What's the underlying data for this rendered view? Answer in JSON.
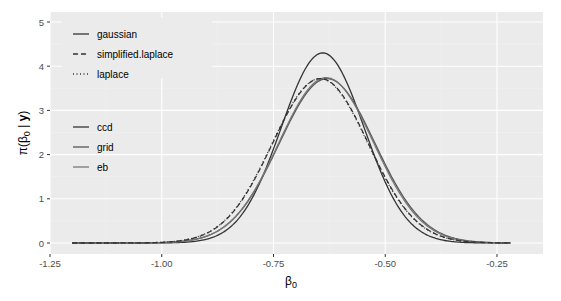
{
  "chart_data": {
    "type": "line",
    "title": "",
    "xlabel": "β0",
    "ylabel": "π(β0 | y)",
    "xlim": [
      -1.25,
      -0.18
    ],
    "ylim": [
      -0.2,
      5.2
    ],
    "x_ticks": [
      -1.25,
      -1.0,
      -0.75,
      -0.5,
      -0.25
    ],
    "x_tick_labels": [
      "-1.25",
      "-1.00",
      "-0.75",
      "-0.50",
      "-0.25"
    ],
    "y_ticks": [
      0,
      1,
      2,
      3,
      4,
      5
    ],
    "y_tick_labels": [
      "0",
      "1",
      "2",
      "3",
      "4",
      "5"
    ],
    "grid": true,
    "x_range_of_curves": [
      -1.2,
      -0.22
    ],
    "legend_position": "inside-top-left",
    "legends": [
      {
        "title": "",
        "entries": [
          "gaussian",
          "simplified.laplace",
          "laplace"
        ],
        "linetypes": [
          "solid",
          "dashed",
          "dotted"
        ]
      },
      {
        "title": "",
        "entries": [
          "ccd",
          "grid",
          "eb"
        ],
        "colors": [
          "#333333",
          "#555555",
          "#777777"
        ]
      }
    ],
    "series": [
      {
        "name": "gaussian / ccd",
        "linetype": "solid",
        "color": "#333333",
        "mean": -0.64,
        "sd": 0.0928,
        "peak": 4.3
      },
      {
        "name": "gaussian / grid",
        "linetype": "solid",
        "color": "#555555",
        "mean": -0.63,
        "sd": 0.107,
        "peak": 3.72
      },
      {
        "name": "gaussian / eb",
        "linetype": "solid",
        "color": "#777777",
        "mean": -0.632,
        "sd": 0.106,
        "peak": 3.74
      },
      {
        "name": "simplified.laplace",
        "linetype": "dashed",
        "color": "#333333",
        "mean": -0.645,
        "sd": 0.107,
        "peak": 3.72
      },
      {
        "name": "laplace",
        "linetype": "dotted",
        "color": "#333333",
        "mean": -0.646,
        "sd": 0.107,
        "peak": 3.72
      }
    ]
  },
  "axes": {
    "x_title_main": "β",
    "x_title_sub": "0",
    "y_title_prefix": "π(β",
    "y_title_sub": "0",
    "y_title_mid": " | ",
    "y_title_bold": "y",
    "y_title_suffix": ")"
  },
  "legend": {
    "group1": [
      "gaussian",
      "simplified.laplace",
      "laplace"
    ],
    "group2": [
      "ccd",
      "grid",
      "eb"
    ]
  },
  "colors": {
    "panel_bg": "#ebebeb",
    "grid_major": "#ffffff",
    "grid_minor": "#f2f2f2"
  }
}
